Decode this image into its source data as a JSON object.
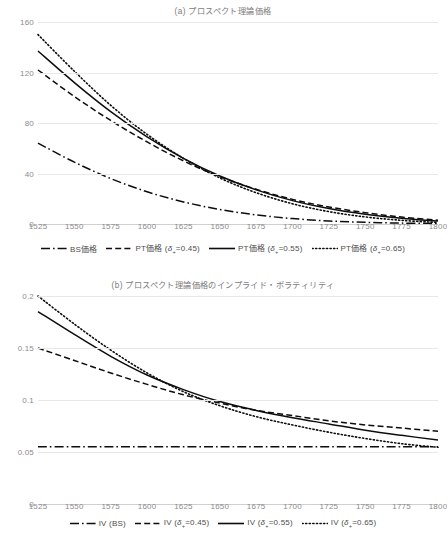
{
  "figures": [
    {
      "id": "a",
      "title": "(a) プロスペクト理論価格",
      "legend": [
        {
          "label_html": "BS価格",
          "dash": "dashdot"
        },
        {
          "label_html": "PT価格 (δ₊=0.45)",
          "dash": "dashed"
        },
        {
          "label_html": "PT価格 (δ₊=0.55)",
          "dash": "solid"
        },
        {
          "label_html": "PT価格 (δ₊=0.65)",
          "dash": "dotted"
        }
      ]
    },
    {
      "id": "b",
      "title": "(b) プロスペクト理論価格のインプライド・ボラティリティ",
      "legend": [
        {
          "label_html": "IV (BS)",
          "dash": "dashdot"
        },
        {
          "label_html": "IV (δ₊=0.45)",
          "dash": "dashed"
        },
        {
          "label_html": "IV (δ₊=0.55)",
          "dash": "solid"
        },
        {
          "label_html": "IV (δ₊=0.65)",
          "dash": "dotted"
        }
      ]
    }
  ],
  "chart_data": [
    {
      "type": "line",
      "title": "(a) プロスペクト理論価格",
      "xlabel": "",
      "ylabel": "",
      "xlim": [
        1525,
        1800
      ],
      "ylim": [
        0,
        160
      ],
      "yticks": [
        0,
        40,
        80,
        120,
        160
      ],
      "xticks": [
        1525,
        1550,
        1575,
        1600,
        1625,
        1650,
        1675,
        1700,
        1725,
        1750,
        1775,
        1800
      ],
      "grid": true,
      "legend_position": "bottom",
      "x": [
        1525,
        1550,
        1575,
        1600,
        1625,
        1650,
        1675,
        1700,
        1725,
        1750,
        1775,
        1800
      ],
      "series": [
        {
          "name": "BS価格",
          "dash": "dashdot",
          "values": [
            64,
            49,
            36,
            25.5,
            17.5,
            11.5,
            7.2,
            4.3,
            2.4,
            1.3,
            0.7,
            0.4
          ]
        },
        {
          "name": "PT価格 (δ₊=0.45)",
          "dash": "dashed",
          "values": [
            122,
            101,
            82,
            65,
            50,
            37.5,
            27.5,
            19.5,
            13.5,
            9,
            5.5,
            3
          ]
        },
        {
          "name": "PT価格 (δ₊=0.55)",
          "dash": "solid",
          "values": [
            137,
            112,
            89,
            69,
            52,
            38,
            27,
            18.5,
            12.3,
            7.8,
            4.6,
            2.3
          ]
        },
        {
          "name": "PT価格 (δ₊=0.65)",
          "dash": "dotted",
          "values": [
            150,
            121,
            94,
            71,
            52,
            36.5,
            24.8,
            16,
            9.8,
            5.6,
            2.9,
            1.2
          ]
        }
      ]
    },
    {
      "type": "line",
      "title": "(b) プロスペクト理論価格のインプライド・ボラティリティ",
      "xlabel": "",
      "ylabel": "",
      "xlim": [
        1525,
        1800
      ],
      "ylim": [
        0,
        0.2
      ],
      "yticks": [
        0,
        0.05,
        0.1,
        0.15,
        0.2
      ],
      "xticks": [
        1525,
        1550,
        1575,
        1600,
        1625,
        1650,
        1675,
        1700,
        1725,
        1750,
        1775,
        1800
      ],
      "grid": true,
      "legend_position": "bottom",
      "x": [
        1525,
        1550,
        1575,
        1600,
        1625,
        1650,
        1675,
        1700,
        1725,
        1750,
        1775,
        1800
      ],
      "series": [
        {
          "name": "IV (BS)",
          "dash": "dashdot",
          "values": [
            0.055,
            0.055,
            0.055,
            0.055,
            0.055,
            0.055,
            0.055,
            0.055,
            0.055,
            0.055,
            0.055,
            0.055
          ]
        },
        {
          "name": "IV (δ₊=0.45)",
          "dash": "dashed",
          "values": [
            0.15,
            0.138,
            0.126,
            0.115,
            0.105,
            0.097,
            0.09,
            0.085,
            0.08,
            0.076,
            0.073,
            0.07
          ]
        },
        {
          "name": "IV (δ₊=0.55)",
          "dash": "solid",
          "values": [
            0.185,
            0.163,
            0.142,
            0.124,
            0.11,
            0.0985,
            0.09,
            0.083,
            0.077,
            0.071,
            0.066,
            0.0615
          ]
        },
        {
          "name": "IV (δ₊=0.65)",
          "dash": "dotted",
          "values": [
            0.2,
            0.173,
            0.148,
            0.126,
            0.108,
            0.0945,
            0.084,
            0.076,
            0.069,
            0.063,
            0.058,
            0.0545
          ]
        }
      ]
    }
  ]
}
